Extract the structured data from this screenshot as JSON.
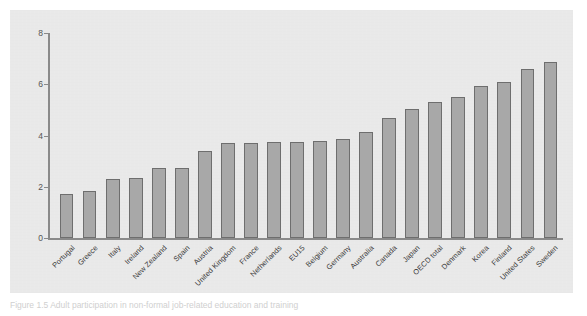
{
  "figure": {
    "caption": "Figure 1.5  Adult participation in non-formal job-related education and training"
  },
  "chart_data": {
    "type": "bar",
    "title": "",
    "subtitle": "",
    "xlabel": "",
    "ylabel": "",
    "ylim": [
      0,
      8
    ],
    "yticks": [
      0,
      2,
      4,
      6,
      8
    ],
    "ytick_labels": [
      "0",
      "2",
      "4",
      "6",
      "8"
    ],
    "grid": false,
    "legend": "none",
    "bar_color": "#a8a8a8",
    "bar_edge_color": "#6e6e6e",
    "panel_background": "#e9e9e9",
    "axis_color": "#8a8a8a",
    "categories": [
      "Portugal",
      "Greece",
      "Italy",
      "Ireland",
      "New Zealand",
      "Spain",
      "Austria",
      "United Kingdom",
      "France",
      "Netherlands",
      "EU15",
      "Belgium",
      "Germany",
      "Australia",
      "Canada",
      "Japan",
      "OECD total",
      "Denmark",
      "Korea",
      "Finland",
      "United States",
      "Sweden"
    ],
    "values": [
      1.7,
      1.85,
      2.3,
      2.35,
      2.75,
      2.75,
      3.4,
      3.7,
      3.7,
      3.75,
      3.75,
      3.8,
      3.85,
      4.15,
      4.7,
      5.05,
      5.3,
      5.5,
      5.95,
      6.1,
      6.6,
      6.85
    ]
  }
}
